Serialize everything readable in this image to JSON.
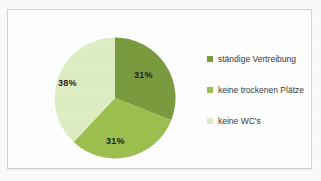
{
  "chart_data": {
    "type": "pie",
    "title": "",
    "labels": [
      "ständige Vertreibung",
      "keine trockenen Plätze",
      "keine WC's"
    ],
    "values": [
      31,
      31,
      38
    ],
    "value_labels": [
      "31%",
      "31%",
      "38%"
    ],
    "unit": "%",
    "colors": [
      "#7a9b3e",
      "#9cc04e",
      "#dfedc4"
    ],
    "legend_position": "right",
    "grid": false,
    "start_angle_deg": 0,
    "direction": "clockwise"
  },
  "legend": {
    "items": [
      {
        "label": "ständige Vertreibung",
        "color": "#7a9b3e"
      },
      {
        "label": "keine trockenen Plätze",
        "color": "#9cc04e"
      },
      {
        "label": "keine WC's",
        "color": "#dfedc4"
      }
    ]
  },
  "slice_labels": {
    "top_right": "31%",
    "bottom": "31%",
    "left": "38%"
  },
  "theme": {
    "frame_border": "#d2d2d2",
    "background": "#ffffff",
    "label_text": "#231f20",
    "legend_text": "#3a3a38"
  }
}
